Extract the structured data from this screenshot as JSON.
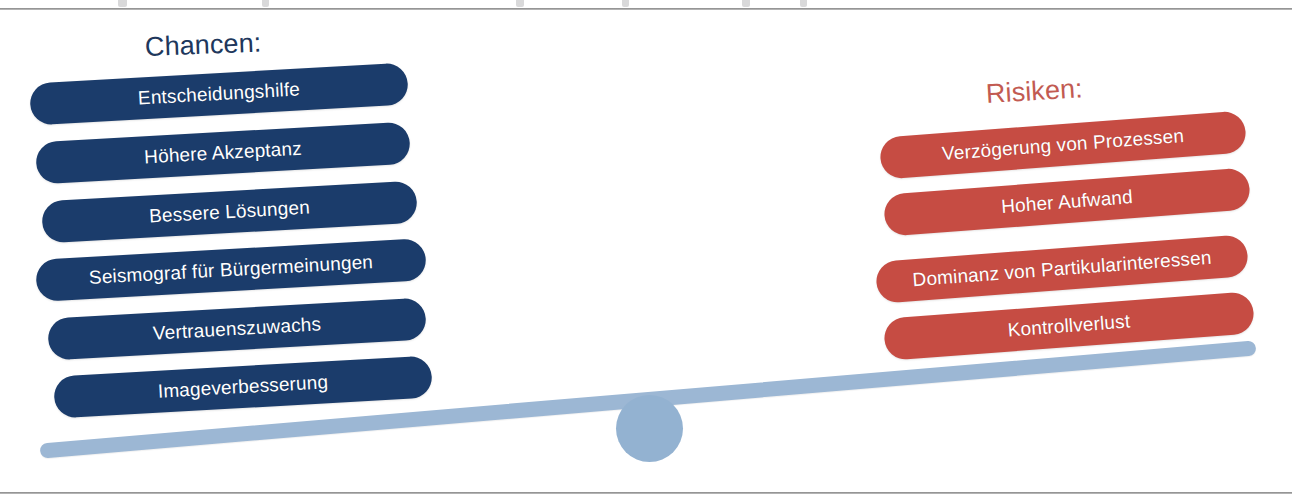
{
  "slide": {
    "width": 1292,
    "height": 501,
    "background_color": "#ffffff",
    "top_rule_color": "#9d9d9d",
    "bottom_rule_color": "#9d9d9d"
  },
  "diagram": {
    "type": "seesaw-balance",
    "tilt": "left-side-down",
    "beam_color": "#9cb7d4",
    "fulcrum_color": "#93b2d1"
  },
  "left_column": {
    "heading": "Chancen:",
    "heading_color": "#20375c",
    "pill_color": "#1b3c6b",
    "pill_text_color": "#ffffff",
    "items": [
      {
        "label": "Entscheidungshilfe"
      },
      {
        "label": "Höhere Akzeptanz"
      },
      {
        "label": "Bessere Lösungen"
      },
      {
        "label": "Seismograf für Bürgermeinungen"
      },
      {
        "label": "Vertrauenszuwachs"
      },
      {
        "label": "Imageverbesserung"
      }
    ]
  },
  "right_column": {
    "heading": "Risiken:",
    "heading_color": "#c25b52",
    "pill_color": "#c64c43",
    "pill_text_color": "#ffffff",
    "items": [
      {
        "label": "Verzögerung von Prozessen"
      },
      {
        "label": "Hoher Aufwand"
      },
      {
        "label": "Dominanz von Partikularinteressen"
      },
      {
        "label": "Kontrollverlust"
      }
    ]
  }
}
